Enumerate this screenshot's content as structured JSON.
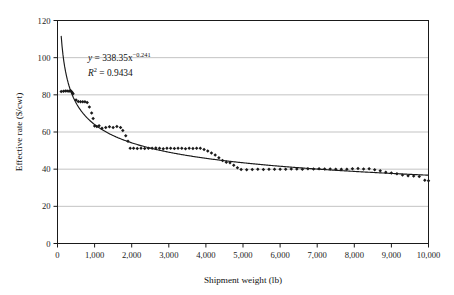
{
  "chart_data": {
    "type": "scatter",
    "title": "",
    "xlabel": "Shipment weight (lb)",
    "ylabel": "Effective rate ($/cwt)",
    "xlim": [
      0,
      10000
    ],
    "ylim": [
      0,
      120
    ],
    "grid": true,
    "grid_axis": "y",
    "legend": "none",
    "xticks": [
      0,
      1000,
      2000,
      3000,
      4000,
      5000,
      6000,
      7000,
      8000,
      9000,
      10000
    ],
    "xticklabels": [
      "0",
      "1,000",
      "2,000",
      "3,000",
      "4,000",
      "5,000",
      "6,000",
      "7,000",
      "8,000",
      "9,000",
      "10,000"
    ],
    "yticks": [
      0,
      20,
      40,
      60,
      80,
      100,
      120
    ],
    "yticklabels": [
      "0",
      "20",
      "40",
      "60",
      "80",
      "100",
      "120"
    ],
    "annotations": {
      "equation_lhs": "y",
      "equation_rhs": "= 338.35x",
      "equation_exponent": "−0.241",
      "r2_lhs": "R",
      "r2_sup": "2",
      "r2_rhs": "= 0.9434",
      "equation_full": "y = 338.35x^-0.241",
      "r2_full": "R2 = 0.9434"
    },
    "fit": {
      "form": "power",
      "coefficient": 338.35,
      "exponent": -0.241,
      "r_squared": 0.9434
    },
    "series": [
      {
        "name": "Effective rate observations",
        "marker": "diamond",
        "color": "#1a1a1a",
        "points": [
          [
            100,
            81.8
          ],
          [
            160,
            81.9
          ],
          [
            210,
            82.0
          ],
          [
            260,
            82.0
          ],
          [
            310,
            81.9
          ],
          [
            350,
            82.3
          ],
          [
            380,
            81.6
          ],
          [
            400,
            81.0
          ],
          [
            420,
            80.6
          ],
          [
            500,
            77.2
          ],
          [
            560,
            76.4
          ],
          [
            620,
            76.3
          ],
          [
            680,
            76.3
          ],
          [
            740,
            76.3
          ],
          [
            800,
            75.9
          ],
          [
            860,
            73.4
          ],
          [
            920,
            70.2
          ],
          [
            960,
            67.3
          ],
          [
            1000,
            63.2
          ],
          [
            1060,
            63.0
          ],
          [
            1120,
            63.3
          ],
          [
            1200,
            62.0
          ],
          [
            1300,
            62.4
          ],
          [
            1400,
            62.8
          ],
          [
            1500,
            62.4
          ],
          [
            1600,
            62.9
          ],
          [
            1700,
            62.4
          ],
          [
            1760,
            60.8
          ],
          [
            1840,
            58.0
          ],
          [
            1900,
            55.0
          ],
          [
            1960,
            51.3
          ],
          [
            2050,
            51.2
          ],
          [
            2150,
            51.1
          ],
          [
            2250,
            51.3
          ],
          [
            2350,
            51.1
          ],
          [
            2450,
            51.3
          ],
          [
            2550,
            51.2
          ],
          [
            2650,
            51.4
          ],
          [
            2750,
            51.2
          ],
          [
            2850,
            51.0
          ],
          [
            2950,
            51.3
          ],
          [
            3050,
            51.2
          ],
          [
            3150,
            51.1
          ],
          [
            3250,
            51.3
          ],
          [
            3350,
            51.2
          ],
          [
            3450,
            51.0
          ],
          [
            3550,
            51.2
          ],
          [
            3650,
            51.1
          ],
          [
            3750,
            51.3
          ],
          [
            3850,
            51.2
          ],
          [
            3950,
            50.6
          ],
          [
            4050,
            49.8
          ],
          [
            4150,
            48.7
          ],
          [
            4250,
            47.6
          ],
          [
            4350,
            46.1
          ],
          [
            4450,
            44.6
          ],
          [
            4550,
            43.7
          ],
          [
            4650,
            43.4
          ],
          [
            4750,
            42.1
          ],
          [
            4850,
            40.8
          ],
          [
            4950,
            39.8
          ],
          [
            5100,
            39.7
          ],
          [
            5250,
            39.8
          ],
          [
            5400,
            39.9
          ],
          [
            5550,
            39.8
          ],
          [
            5700,
            39.9
          ],
          [
            5850,
            40.0
          ],
          [
            6000,
            39.9
          ],
          [
            6150,
            39.9
          ],
          [
            6300,
            40.1
          ],
          [
            6450,
            40.1
          ],
          [
            6600,
            40.0
          ],
          [
            6750,
            40.2
          ],
          [
            6900,
            40.1
          ],
          [
            7050,
            40.2
          ],
          [
            7200,
            40.1
          ],
          [
            7350,
            40.1
          ],
          [
            7500,
            40.0
          ],
          [
            7650,
            40.0
          ],
          [
            7800,
            39.9
          ],
          [
            7950,
            40.2
          ],
          [
            8100,
            40.3
          ],
          [
            8250,
            40.1
          ],
          [
            8400,
            40.2
          ],
          [
            8550,
            39.7
          ],
          [
            8700,
            39.1
          ],
          [
            8850,
            38.4
          ],
          [
            9000,
            38.0
          ],
          [
            9150,
            37.5
          ],
          [
            9300,
            36.9
          ],
          [
            9450,
            36.4
          ],
          [
            9600,
            36.3
          ],
          [
            9750,
            36.1
          ],
          [
            9900,
            34.0
          ],
          [
            10000,
            33.8
          ]
        ]
      }
    ],
    "trendline": {
      "name": "Power fit",
      "color": "#1a1a1a",
      "x_start": 100,
      "x_end": 10000,
      "description": "y = 338.35 * x^(-0.241)"
    }
  }
}
